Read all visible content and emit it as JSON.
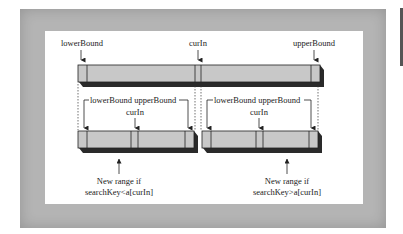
{
  "diagram": {
    "top_array": {
      "labels": {
        "lower": "lowerBound",
        "mid": "curIn",
        "upper": "upperBound"
      }
    },
    "left_subarray": {
      "labels": {
        "bounds": "lowerBound upperBound",
        "mid": "curIn"
      },
      "caption_line1": "New range if",
      "caption_line2": "searchKey<a[curIn]"
    },
    "right_subarray": {
      "labels": {
        "bounds": "lowerBound upperBound",
        "mid": "curIn"
      },
      "caption_line1": "New range if",
      "caption_line2": "searchKey>a[curIn]"
    },
    "colors": {
      "frame": "#b4b4b4",
      "panel": "#ffffff",
      "bar_fill": "#c8c8c8",
      "bar_shadow": "#2a2a2a",
      "stroke": "#222222"
    }
  }
}
